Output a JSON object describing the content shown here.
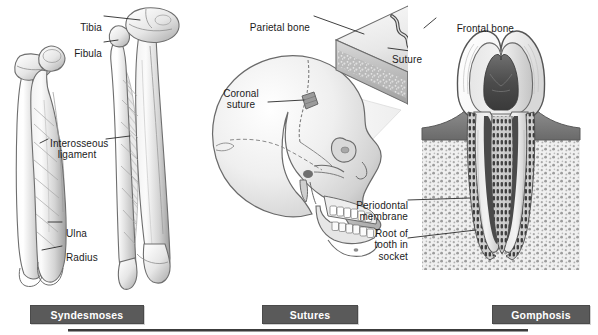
{
  "figure": {
    "bg_color": "#ffffff",
    "ink_color": "#1b1b1b",
    "bar_color": "#5a5a5a",
    "bar_text_color": "#ffffff"
  },
  "panels": [
    {
      "id": "syndesmoses",
      "caption": "Syndesmoses",
      "labels": [
        {
          "name": "tibia",
          "text": "Tibia"
        },
        {
          "name": "fibula",
          "text": "Fibula"
        },
        {
          "name": "interosseous-ligament",
          "text": "Interosseous\nligament"
        },
        {
          "name": "ulna",
          "text": "Ulna"
        },
        {
          "name": "radius",
          "text": "Radius"
        }
      ]
    },
    {
      "id": "sutures",
      "caption": "Sutures",
      "labels": [
        {
          "name": "parietal-bone",
          "text": "Parietal bone"
        },
        {
          "name": "coronal-suture",
          "text": "Coronal\nsuture"
        },
        {
          "name": "suture",
          "text": "Suture"
        }
      ]
    },
    {
      "id": "gomphosis",
      "caption": "Gomphosis",
      "labels": [
        {
          "name": "frontal-bone",
          "text": "Frontal bone"
        },
        {
          "name": "periodontal-membrane",
          "text": "Periodontal\nmembrane"
        },
        {
          "name": "root-of-tooth-in-socket",
          "text": "Root of\ntooth in\nsocket"
        }
      ]
    }
  ]
}
